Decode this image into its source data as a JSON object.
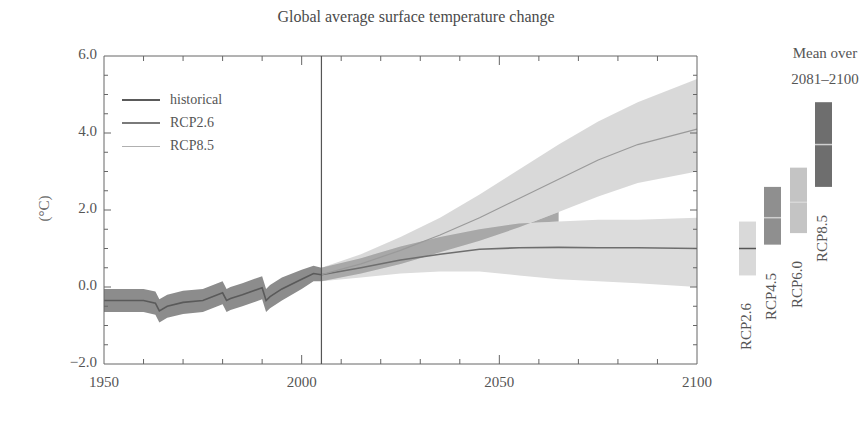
{
  "chart_data": {
    "type": "line",
    "title": "Global average surface temperature change",
    "xlabel": "",
    "ylabel": "(°C)",
    "xlim": [
      1950,
      2100
    ],
    "ylim": [
      -2.0,
      6.0
    ],
    "x_ticks": [
      "1950",
      "2000",
      "2050",
      "2100"
    ],
    "y_ticks": [
      "6.0",
      "4.0",
      "2.0",
      "0.0",
      "-2.0"
    ],
    "grid": false,
    "legend_position": "upper-left",
    "legend": [
      "historical",
      "RCP2.6",
      "RCP8.5"
    ],
    "divider_year": 2005,
    "series": [
      {
        "name": "historical",
        "color": "#5a5a5a",
        "band_color": "#8c8c8c",
        "x": [
          1950,
          1955,
          1960,
          1963,
          1964,
          1966,
          1970,
          1975,
          1980,
          1981,
          1982,
          1985,
          1990,
          1991,
          1992,
          1995,
          2000,
          2003,
          2005
        ],
        "y": [
          -0.35,
          -0.35,
          -0.35,
          -0.42,
          -0.62,
          -0.5,
          -0.4,
          -0.35,
          -0.15,
          -0.35,
          -0.3,
          -0.2,
          -0.02,
          -0.35,
          -0.25,
          -0.05,
          0.2,
          0.35,
          0.32
        ],
        "lower": [
          -0.65,
          -0.65,
          -0.65,
          -0.72,
          -0.92,
          -0.8,
          -0.7,
          -0.65,
          -0.45,
          -0.65,
          -0.6,
          -0.5,
          -0.32,
          -0.65,
          -0.55,
          -0.35,
          -0.05,
          0.15,
          0.15
        ],
        "upper": [
          -0.05,
          -0.05,
          -0.05,
          -0.12,
          -0.32,
          -0.2,
          -0.1,
          -0.05,
          0.15,
          -0.05,
          0.0,
          0.1,
          0.28,
          -0.05,
          0.05,
          0.25,
          0.45,
          0.55,
          0.5
        ]
      },
      {
        "name": "RCP2.6",
        "color": "#6e6e6e",
        "band_color": "#dcdcdc",
        "x": [
          2005,
          2015,
          2025,
          2035,
          2045,
          2055,
          2065,
          2075,
          2085,
          2100
        ],
        "y": [
          0.32,
          0.5,
          0.7,
          0.85,
          0.98,
          1.02,
          1.03,
          1.02,
          1.02,
          1.0
        ],
        "lower": [
          0.15,
          0.25,
          0.35,
          0.4,
          0.4,
          0.3,
          0.2,
          0.15,
          0.1,
          0.0
        ],
        "upper": [
          0.5,
          0.75,
          1.05,
          1.3,
          1.5,
          1.65,
          1.7,
          1.75,
          1.75,
          1.8
        ]
      },
      {
        "name": "RCP8.5",
        "color": "#9a9a9a",
        "band_color": "#d2d2d2",
        "x": [
          2005,
          2015,
          2025,
          2035,
          2045,
          2055,
          2065,
          2075,
          2085,
          2100
        ],
        "y": [
          0.32,
          0.6,
          0.95,
          1.35,
          1.8,
          2.3,
          2.8,
          3.3,
          3.7,
          4.1
        ],
        "lower": [
          0.15,
          0.35,
          0.6,
          0.9,
          1.2,
          1.55,
          1.95,
          2.35,
          2.7,
          3.0
        ],
        "upper": [
          0.5,
          0.85,
          1.3,
          1.8,
          2.4,
          3.05,
          3.7,
          4.3,
          4.8,
          5.4
        ]
      }
    ],
    "overlap_band_color": "#a8a8a8",
    "mean_panel": {
      "title_line1": "Mean over",
      "title_line2": "2081–2100",
      "bars": [
        {
          "name": "RCP2.6",
          "low": 0.3,
          "mean": 1.0,
          "high": 1.7,
          "color": "#d9d9d9",
          "mean_color": "#555555"
        },
        {
          "name": "RCP4.5",
          "low": 1.1,
          "mean": 1.8,
          "high": 2.6,
          "color": "#8f8f8f",
          "mean_color": "#cfcfcf"
        },
        {
          "name": "RCP6.0",
          "low": 1.4,
          "mean": 2.2,
          "high": 3.1,
          "color": "#c4c4c4",
          "mean_color": "#d8d8d8"
        },
        {
          "name": "RCP8.5",
          "low": 2.6,
          "mean": 3.7,
          "high": 4.8,
          "color": "#6e6e6e",
          "mean_color": "#d0d0d0"
        }
      ]
    }
  }
}
